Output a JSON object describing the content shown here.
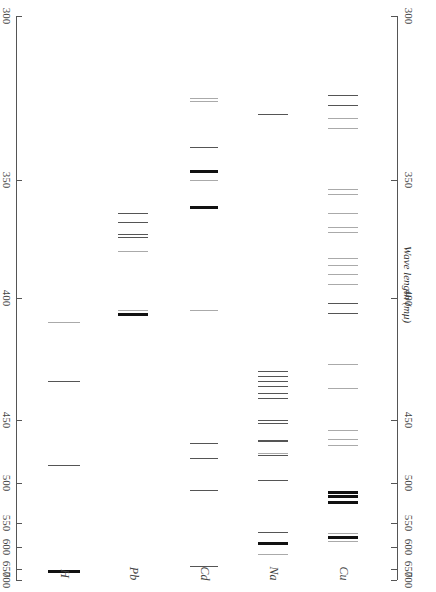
{
  "chart_data": {
    "type": "spectral-lines",
    "title": "",
    "xlabel": "",
    "ylabel": "Wave length (mμ)",
    "ylim": [
      300,
      700
    ],
    "y_scale": "non-linear (dispersion scale, prism spectrum)",
    "y_ticks": [
      300,
      350,
      400,
      450,
      500,
      550,
      600,
      650,
      700
    ],
    "categories": [
      "H",
      "Pb",
      "Cd",
      "Na",
      "Cu"
    ],
    "series": [
      {
        "name": "H",
        "lines_nm": [
          410,
          434,
          486,
          656
        ],
        "strength": [
          "faint",
          "medium",
          "medium",
          "strong"
        ]
      },
      {
        "name": "Pb",
        "lines_nm": [
          364,
          368,
          373,
          374,
          380,
          405,
          406
        ],
        "strength": [
          "medium",
          "medium",
          "medium",
          "medium",
          "faint",
          "faint",
          "strong"
        ]
      },
      {
        "name": "Cd",
        "lines_nm": [
          325,
          326,
          340,
          347,
          350,
          361,
          405,
          468,
          480,
          509,
          644
        ],
        "strength": [
          "faint",
          "faint",
          "medium",
          "strong",
          "faint",
          "strong",
          "faint",
          "medium",
          "medium",
          "medium",
          "medium"
        ]
      },
      {
        "name": "Na",
        "lines_nm": [
          330,
          430,
          432,
          434,
          436,
          439,
          441,
          450,
          452,
          466,
          467,
          476,
          478,
          498,
          568,
          589,
          590,
          616
        ],
        "strength": [
          "medium",
          "medium",
          "medium",
          "medium",
          "medium",
          "medium",
          "medium",
          "medium",
          "medium",
          "medium",
          "medium",
          "faint",
          "medium",
          "medium",
          "medium",
          "strong",
          "strong",
          "faint"
        ]
      },
      {
        "name": "Cu",
        "lines_nm": [
          324,
          327,
          331,
          334,
          354,
          356,
          364,
          370,
          372,
          383,
          386,
          390,
          394,
          402,
          406,
          427,
          437,
          458,
          465,
          470,
          510,
          515,
          522,
          570,
          578,
          587
        ],
        "strength": [
          "medium",
          "medium",
          "faint",
          "faint",
          "faint",
          "faint",
          "faint",
          "faint",
          "faint",
          "faint",
          "faint",
          "faint",
          "faint",
          "medium",
          "medium",
          "faint",
          "faint",
          "faint",
          "faint",
          "faint",
          "strong",
          "strong",
          "strong",
          "faint",
          "strong",
          "faint"
        ]
      }
    ],
    "grid": false,
    "legend": "none (column labels at bottom)"
  },
  "axis": {
    "left_ticks": [
      "300",
      "350",
      "400",
      "450",
      "500",
      "550",
      "600",
      "650",
      "700"
    ],
    "right_ticks": [
      "300",
      "350",
      "400",
      "450",
      "500",
      "550",
      "600",
      "650",
      "700"
    ],
    "title": "Wave length (mμ)"
  },
  "columns": {
    "labels": [
      "H",
      "Pb",
      "Cd",
      "Na",
      "Cu"
    ]
  },
  "colors": {
    "line": "#555555",
    "strong": "#111111",
    "faint": "#aaaaaa"
  }
}
